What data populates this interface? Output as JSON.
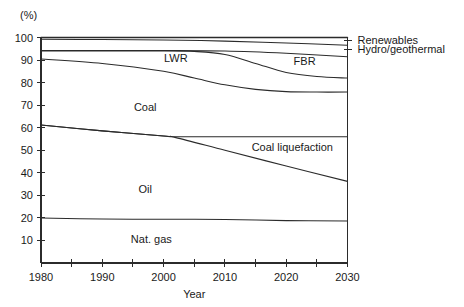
{
  "chart_data": {
    "type": "area",
    "title": "",
    "subtitle": "",
    "xlabel": "Year",
    "ylabel": "",
    "unit_label": "(%)",
    "xlim": [
      1980,
      2030
    ],
    "ylim": [
      0,
      100
    ],
    "grid": false,
    "legend_position": "in-plot and right-of-plot labels",
    "x_ticks": [
      1980,
      1985,
      1990,
      1995,
      2000,
      2005,
      2010,
      2015,
      2020,
      2025,
      2030
    ],
    "x_tick_labels": [
      "1980",
      "",
      "1990",
      "",
      "2000",
      "",
      "2010",
      "",
      "2020",
      "",
      "2030"
    ],
    "y_ticks": [
      0,
      10,
      20,
      30,
      40,
      50,
      60,
      70,
      80,
      90,
      100
    ],
    "y_tick_labels": [
      "",
      "10",
      "20",
      "30",
      "40",
      "50",
      "60",
      "70",
      "80",
      "90",
      "100"
    ],
    "boundaries": [
      {
        "name": "total-top",
        "label_ref": "Renewables",
        "x": [
          1980,
          1990,
          2000,
          2010,
          2020,
          2030
        ],
        "values": [
          100,
          100,
          100,
          100,
          100,
          100
        ]
      },
      {
        "name": "renewables-lower",
        "label_ref": "Hydro/geothermal",
        "x": [
          1980,
          1990,
          2000,
          2010,
          2020,
          2030
        ],
        "values": [
          99.2,
          99.1,
          98.9,
          98.4,
          97.6,
          96.6
        ]
      },
      {
        "name": "hydro-geothermal-lower",
        "label_ref": "FBR",
        "x": [
          1980,
          1990,
          2000,
          2010,
          2020,
          2030
        ],
        "values": [
          94.2,
          94.2,
          94.2,
          94.0,
          93.0,
          91.5
        ]
      },
      {
        "name": "fbr-lower",
        "label_ref": "LWR",
        "x": [
          1980,
          1990,
          2000,
          2005,
          2010,
          2015,
          2020,
          2025,
          2030
        ],
        "values": [
          94.0,
          94.0,
          94.0,
          93.8,
          92.5,
          88.5,
          84.5,
          82.7,
          82.0
        ]
      },
      {
        "name": "lwr-lower",
        "label_ref": "Coal",
        "x": [
          1980,
          1990,
          2000,
          2005,
          2010,
          2015,
          2020,
          2025,
          2030
        ],
        "values": [
          90.5,
          88.5,
          85.0,
          82.0,
          79.0,
          77.0,
          76.0,
          75.8,
          75.8
        ]
      },
      {
        "name": "coal-lower",
        "label_ref": "Coal liquefaction",
        "x": [
          1980,
          1990,
          2000,
          2002,
          2010,
          2020,
          2030
        ],
        "values": [
          61.2,
          58.6,
          56.3,
          56.0,
          56.0,
          56.0,
          56.0
        ]
      },
      {
        "name": "coal-liquefaction-lower",
        "label_ref": "Oil",
        "x": [
          1980,
          1990,
          2000,
          2002,
          2010,
          2020,
          2030
        ],
        "values": [
          61.2,
          58.6,
          56.3,
          55.6,
          50.0,
          43.0,
          36.2
        ]
      },
      {
        "name": "oil-lower",
        "label_ref": "Nat. gas",
        "x": [
          1980,
          1990,
          2000,
          2010,
          2020,
          2030
        ],
        "values": [
          20.0,
          19.5,
          19.4,
          19.3,
          18.8,
          18.6
        ]
      }
    ],
    "band_labels": [
      {
        "text": "LWR",
        "x": 2002,
        "y": 91.0
      },
      {
        "text": "FBR",
        "x": 2023,
        "y": 89.5
      },
      {
        "text": "Coal",
        "x": 1997,
        "y": 69.0
      },
      {
        "text": "Coal liquefaction",
        "x": 2021,
        "y": 51.5
      },
      {
        "text": "Oil",
        "x": 1997,
        "y": 33.0
      },
      {
        "text": "Nat. gas",
        "x": 1998,
        "y": 10.5
      }
    ],
    "right_labels": [
      {
        "text": "Renewables",
        "y": 98.8
      },
      {
        "text": "Hydro/geothermal",
        "y": 94.8
      }
    ],
    "colors": {
      "line": "#2b2b2b",
      "axis": "#2b2b2b",
      "background": "#ffffff",
      "text": "#1a1a1a"
    }
  }
}
